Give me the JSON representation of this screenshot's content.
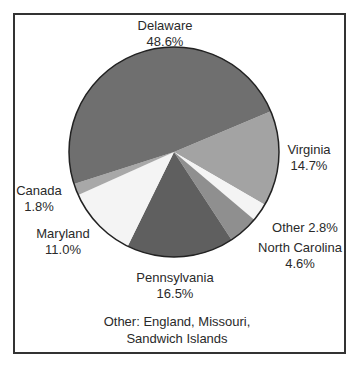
{
  "chart_data": {
    "type": "pie",
    "title": "",
    "slices": [
      {
        "label": "Virginia",
        "value": 14.7,
        "display": "14.7%",
        "color": "#a3a3a3"
      },
      {
        "label": "Other",
        "value": 2.8,
        "display": "2.8%",
        "color": "#f4f4f4"
      },
      {
        "label": "North Carolina",
        "value": 4.6,
        "display": "4.6%",
        "color": "#8f8f8f"
      },
      {
        "label": "Pennsylvania",
        "value": 16.5,
        "display": "16.5%",
        "color": "#5f5f5f"
      },
      {
        "label": "Maryland",
        "value": 11.0,
        "display": "11.0%",
        "color": "#f4f4f4"
      },
      {
        "label": "Canada",
        "value": 1.8,
        "display": "1.8%",
        "color": "#a8a8a8"
      },
      {
        "label": "Delaware",
        "value": 48.6,
        "display": "48.6%",
        "color": "#6f6f6f"
      }
    ],
    "start_angle_deg": -22.8,
    "direction": "clockwise",
    "legend": "none (direct labels)",
    "annotation": "Other: England, Missouri, Sandwich Islands"
  },
  "labels": {
    "delaware": {
      "name": "Delaware",
      "pct": "48.6%"
    },
    "virginia": {
      "name": "Virginia",
      "pct": "14.7%"
    },
    "other": {
      "text": "Other 2.8%"
    },
    "north_carolina": {
      "name": "North Carolina",
      "pct": "4.6%"
    },
    "pennsylvania": {
      "name": "Pennsylvania",
      "pct": "16.5%"
    },
    "maryland": {
      "name": "Maryland",
      "pct": "11.0%"
    },
    "canada": {
      "name": "Canada",
      "pct": "1.8%"
    }
  },
  "note": {
    "line1": "Other: England, Missouri,",
    "line2": "Sandwich Islands"
  }
}
